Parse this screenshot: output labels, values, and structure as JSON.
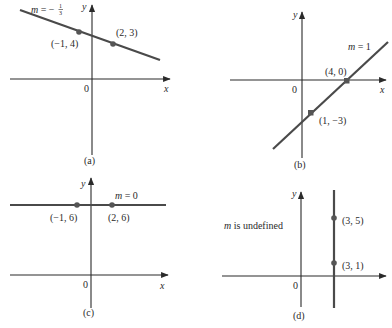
{
  "figure": {
    "colors": {
      "axis": "#2a2a2a",
      "line": "#4a4a4a",
      "point": "#555555",
      "text": "#2a2a2a",
      "background": "#ffffff"
    },
    "panels": [
      {
        "id": "a",
        "caption": "(a)",
        "slope_label": "m = −1/3",
        "slope_prefix": "m",
        "slope_eq": " = −",
        "slope_num": "1",
        "slope_den": "3",
        "origin_label": "0",
        "x_axis_label": "x",
        "y_axis_label": "y",
        "points": [
          {
            "label": "(−1, 4)",
            "x": -1,
            "y": 4
          },
          {
            "label": "(2, 3)",
            "x": 2,
            "y": 3
          }
        ],
        "slope": "-1/3"
      },
      {
        "id": "b",
        "caption": "(b)",
        "slope_label": "m = 1",
        "slope_prefix": "m",
        "slope_eq": " = 1",
        "origin_label": "0",
        "x_axis_label": "x",
        "y_axis_label": "y",
        "points": [
          {
            "label": "(4, 0)",
            "x": 4,
            "y": 0
          },
          {
            "label": "(1, −3)",
            "x": 1,
            "y": -3
          }
        ],
        "slope": "1"
      },
      {
        "id": "c",
        "caption": "(c)",
        "slope_label": "m = 0",
        "slope_prefix": "m",
        "slope_eq": " = 0",
        "origin_label": "0",
        "x_axis_label": "x",
        "y_axis_label": "y",
        "points": [
          {
            "label": "(−1, 6)",
            "x": -1,
            "y": 6
          },
          {
            "label": "(2, 6)",
            "x": 2,
            "y": 6
          }
        ],
        "slope": "0"
      },
      {
        "id": "d",
        "caption": "(d)",
        "slope_label": "m is undefined",
        "slope_prefix": "m",
        "slope_eq": " is undefined",
        "origin_label": "0",
        "y_axis_label": "y",
        "points": [
          {
            "label": "(3, 5)",
            "x": 3,
            "y": 5
          },
          {
            "label": "(3, 1)",
            "x": 3,
            "y": 1
          }
        ],
        "slope": "undefined"
      }
    ]
  }
}
